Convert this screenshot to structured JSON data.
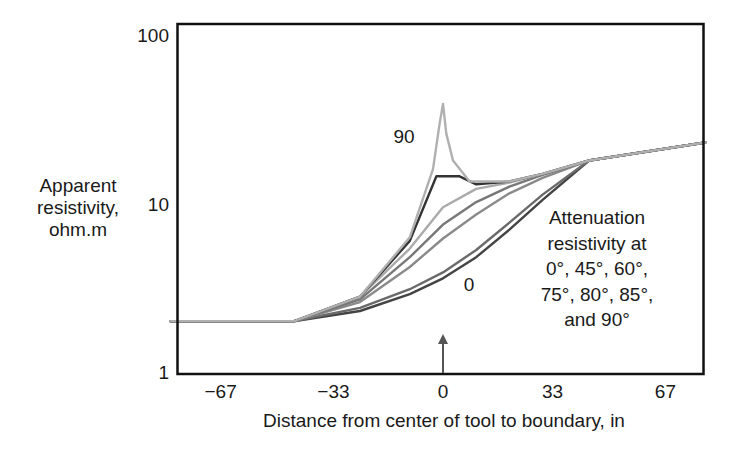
{
  "chart_data": {
    "type": "line",
    "title": "",
    "xlabel": "Distance from center of tool to boundary, in",
    "ylabel": [
      "Apparent",
      "resistivity,",
      "ohm.m"
    ],
    "yscale": "log",
    "ylim": [
      1,
      100
    ],
    "xlim": [
      -82,
      79
    ],
    "x_ticks": [
      "−67",
      "−33",
      "0",
      "33",
      "67"
    ],
    "x_tick_values": [
      -67,
      -33,
      0,
      33,
      67
    ],
    "y_ticks": [
      "1",
      "10",
      "100"
    ],
    "y_tick_values": [
      1,
      10,
      100
    ],
    "grid": false,
    "legend": "none",
    "annotations": {
      "top_curve_label": "90",
      "bottom_curve_label": "0",
      "description": [
        "Attenuation",
        "resistivity at",
        "0°, 45°, 60°,",
        "75°, 80°, 85°,",
        "and 90°"
      ],
      "boundary_arrow_x": 0
    },
    "series": [
      {
        "name": "0°",
        "color": "#444444",
        "x": [
          -82,
          -45,
          -25,
          -10,
          0,
          10,
          20,
          30,
          44,
          79
        ],
        "y": [
          2.0,
          2.0,
          2.3,
          2.9,
          3.6,
          4.8,
          7.0,
          10.5,
          18,
          23
        ]
      },
      {
        "name": "45°",
        "color": "#6a6a6a",
        "x": [
          -82,
          -45,
          -25,
          -10,
          0,
          10,
          20,
          30,
          44,
          79
        ],
        "y": [
          2.0,
          2.0,
          2.4,
          3.1,
          3.9,
          5.3,
          7.7,
          11.3,
          18,
          23
        ]
      },
      {
        "name": "60°",
        "color": "#8a8a8a",
        "x": [
          -82,
          -45,
          -25,
          -10,
          0,
          10,
          20,
          30,
          44,
          79
        ],
        "y": [
          2.0,
          2.0,
          2.6,
          4.2,
          6.2,
          8.6,
          11.5,
          14.2,
          18,
          23
        ]
      },
      {
        "name": "75°",
        "color": "#777777",
        "x": [
          -82,
          -45,
          -25,
          -10,
          0,
          10,
          20,
          30,
          44,
          79
        ],
        "y": [
          2.0,
          2.0,
          2.7,
          4.8,
          7.5,
          10.2,
          12.6,
          14.8,
          18,
          23
        ]
      },
      {
        "name": "80°",
        "color": "#aaaaaa",
        "x": [
          -82,
          -45,
          -25,
          -10,
          0,
          10,
          20,
          30,
          44,
          79
        ],
        "y": [
          2.0,
          2.0,
          2.8,
          5.4,
          9.5,
          12.2,
          13.3,
          15.0,
          18,
          23
        ]
      },
      {
        "name": "85°",
        "color": "#333333",
        "x": [
          -82,
          -45,
          -25,
          -10,
          -2,
          5,
          10,
          20,
          30,
          44,
          79
        ],
        "y": [
          2.0,
          2.0,
          2.8,
          6.0,
          14.5,
          14.5,
          13.0,
          13.5,
          15.0,
          18,
          23
        ]
      },
      {
        "name": "90°",
        "color": "#b0b0b0",
        "x": [
          -82,
          -45,
          -25,
          -10,
          -3,
          -1,
          0,
          1,
          3,
          8,
          20,
          30,
          44,
          79
        ],
        "y": [
          2.0,
          2.0,
          2.8,
          6.3,
          16,
          30,
          39,
          26,
          18,
          13.5,
          13.5,
          15.0,
          18,
          23
        ]
      }
    ]
  }
}
